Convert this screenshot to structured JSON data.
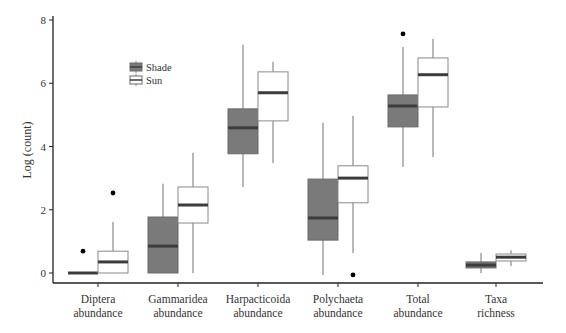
{
  "chart_data": {
    "type": "boxplot",
    "title": "",
    "xlabel": "",
    "ylabel": "Log (count)",
    "ylim": [
      0,
      8
    ],
    "yticks": [
      0,
      2,
      4,
      6,
      8
    ],
    "grid": false,
    "legend": {
      "position": "upper-left inside",
      "entries": [
        {
          "name": "Shade",
          "color": "#7a7a7a"
        },
        {
          "name": "Sun",
          "color": "#ffffff"
        }
      ]
    },
    "categories": [
      {
        "label": [
          "Diptera",
          "abundance"
        ]
      },
      {
        "label": [
          "Gammaridea",
          "abundance"
        ]
      },
      {
        "label": [
          "Harpacticoida",
          "abundance"
        ]
      },
      {
        "label": [
          "Polychaeta",
          "abundance"
        ]
      },
      {
        "label": [
          "Total",
          "abundance"
        ]
      },
      {
        "label": [
          "Taxa",
          "richness"
        ]
      }
    ],
    "series": [
      {
        "name": "Shade",
        "color": "#7a7a7a",
        "boxes": [
          {
            "whisker_low": 0,
            "q1": 0,
            "median": 0,
            "q3": 0,
            "whisker_high": 0,
            "outliers": [
              0.69
            ]
          },
          {
            "whisker_low": 0,
            "q1": 0,
            "median": 0.85,
            "q3": 1.77,
            "whisker_high": 2.82,
            "outliers": []
          },
          {
            "whisker_low": 2.72,
            "q1": 3.77,
            "median": 4.59,
            "q3": 5.19,
            "whisker_high": 7.22,
            "outliers": []
          },
          {
            "whisker_low": -0.06,
            "q1": 1.04,
            "median": 1.74,
            "q3": 2.97,
            "whisker_high": 4.75,
            "outliers": []
          },
          {
            "whisker_low": 3.35,
            "q1": 4.62,
            "median": 5.28,
            "q3": 5.63,
            "whisker_high": 7.15,
            "outliers": [
              7.56
            ]
          },
          {
            "whisker_low": 0.0,
            "q1": 0.16,
            "median": 0.25,
            "q3": 0.35,
            "whisker_high": 0.63,
            "outliers": []
          }
        ]
      },
      {
        "name": "Sun",
        "color": "#ffffff",
        "boxes": [
          {
            "whisker_low": 0,
            "q1": 0,
            "median": 0.35,
            "q3": 0.69,
            "whisker_high": 1.61,
            "outliers": [
              2.53
            ]
          },
          {
            "whisker_low": 0,
            "q1": 1.58,
            "median": 2.15,
            "q3": 2.72,
            "whisker_high": 3.8,
            "outliers": []
          },
          {
            "whisker_low": 3.48,
            "q1": 4.81,
            "median": 5.7,
            "q3": 6.36,
            "whisker_high": 6.68,
            "outliers": []
          },
          {
            "whisker_low": 0.63,
            "q1": 2.22,
            "median": 3.0,
            "q3": 3.39,
            "whisker_high": 4.97,
            "outliers": [
              -0.06
            ]
          },
          {
            "whisker_low": 3.67,
            "q1": 5.25,
            "median": 6.27,
            "q3": 6.8,
            "whisker_high": 7.41,
            "outliers": []
          },
          {
            "whisker_low": 0.22,
            "q1": 0.38,
            "median": 0.5,
            "q3": 0.6,
            "whisker_high": 0.72,
            "outliers": []
          }
        ]
      }
    ]
  }
}
